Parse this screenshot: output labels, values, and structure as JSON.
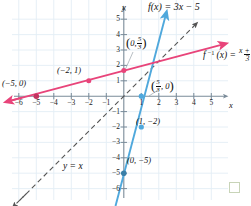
{
  "figure": {
    "title": "f(x) = 3x − 5",
    "inverse_label_prefix": "f",
    "inverse_label_sup": "−1",
    "inverse_label_mid": "(x) =",
    "inverse_numerator": "x + 5",
    "inverse_denominator": "3",
    "identity_line_label": "y = x",
    "x_axis_label": "x",
    "y_axis_label": "y",
    "decoration_square": "green-square-marker"
  },
  "axes": {
    "x_ticks": [
      "−6",
      "−5",
      "−4",
      "−3",
      "−2",
      "−1",
      "1",
      "2",
      "3",
      "4",
      "5"
    ],
    "y_ticks": [
      "5",
      "4",
      "3",
      "2",
      "1",
      "−1",
      "−2",
      "−3",
      "−4",
      "−5",
      "−6"
    ]
  },
  "point_labels": {
    "f_inv_y_intercept_open": "(",
    "f_inv_y_intercept_x": "0,",
    "f_inv_y_intercept_num": "5",
    "f_inv_y_intercept_den": "3",
    "f_inv_y_intercept_close": ")",
    "f_inv_x_intercept_open": "(",
    "f_inv_x_intercept_num": "5",
    "f_inv_x_intercept_den": "3",
    "f_inv_x_intercept_y": ", 0",
    "f_inv_x_intercept_close": ")",
    "f_inv_point_m5_0": "(−5, 0)",
    "f_inv_point_m2_1": "(−2, 1)",
    "f_point_1_m2": "(1, −2)",
    "f_point_0_m5": "(0, −5)"
  },
  "colors": {
    "f_line": "#4fa8dc",
    "f_inverse_line": "#e8447a",
    "identity_line": "#555555",
    "grid": "#e3edf5",
    "axis": "#7a8b99",
    "decoration": "#c8d4b8"
  },
  "chart_data": {
    "type": "line",
    "title": "f(x) = 3x − 5",
    "xlabel": "x",
    "ylabel": "y",
    "xlim": [
      -6.8,
      6.0
    ],
    "ylim": [
      -6.6,
      5.8
    ],
    "grid": true,
    "legend": "inline-annotations",
    "series": [
      {
        "name": "f(x) = 3x - 5",
        "color": "#4fa8dc",
        "slope": 3,
        "intercept": -5,
        "style": "solid",
        "points": [
          {
            "x": 0,
            "y": -5,
            "label": "(0, −5)"
          },
          {
            "x": 1,
            "y": -2,
            "label": "(1, −2)"
          },
          {
            "x": 1.6667,
            "y": 0,
            "label": "(5/3, 0)"
          }
        ]
      },
      {
        "name": "f^-1(x) = (x + 5)/3",
        "color": "#e8447a",
        "slope": 0.3333,
        "intercept": 1.6667,
        "style": "solid",
        "points": [
          {
            "x": -5,
            "y": 0,
            "label": "(−5, 0)"
          },
          {
            "x": -2,
            "y": 1,
            "label": "(−2, 1)"
          },
          {
            "x": 0,
            "y": 1.6667,
            "label": "(0, 5/3)"
          }
        ]
      },
      {
        "name": "y = x",
        "color": "#555555",
        "slope": 1,
        "intercept": 0,
        "style": "dashed",
        "points": []
      }
    ]
  }
}
